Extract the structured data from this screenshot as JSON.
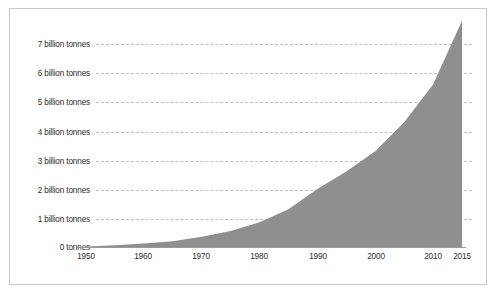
{
  "chart_data": {
    "type": "area",
    "title": "",
    "subtitle": "",
    "xlabel": "",
    "ylabel": "",
    "grid": true,
    "legend": "none",
    "series_color": "#8f8f8f",
    "xlim": [
      1950,
      2015
    ],
    "ylim": [
      0,
      7.8
    ],
    "x_tick_labels": [
      "1950",
      "1960",
      "1970",
      "1980",
      "1990",
      "2000",
      "2010",
      "2015"
    ],
    "x_ticks": [
      1950,
      1960,
      1970,
      1980,
      1990,
      2000,
      2010,
      2015
    ],
    "y_tick_labels": [
      "0 tonnes",
      "1 billion tonnes",
      "2 billion tonnes",
      "3 billion tonnes",
      "4 billion tonnes",
      "5 billion tonnes",
      "6 billion tonnes",
      "7 billion tonnes"
    ],
    "y_ticks": [
      0,
      1,
      2,
      3,
      4,
      5,
      6,
      7
    ],
    "x": [
      1950,
      1955,
      1960,
      1965,
      1970,
      1975,
      1980,
      1985,
      1990,
      1995,
      2000,
      2005,
      2010,
      2015
    ],
    "values": [
      0.02,
      0.06,
      0.12,
      0.2,
      0.35,
      0.55,
      0.85,
      1.3,
      2.0,
      2.6,
      3.3,
      4.3,
      5.6,
      7.8
    ],
    "series": [
      {
        "name": "Global plastic production",
        "values": [
          0.02,
          0.06,
          0.12,
          0.2,
          0.35,
          0.55,
          0.85,
          1.3,
          2.0,
          2.6,
          3.3,
          4.3,
          5.6,
          7.8
        ]
      }
    ]
  },
  "colors": {
    "area_fill": "#8f8f8f",
    "gridline": "#bfbfbf",
    "axis": "#9a9a9a",
    "frame_border": "#c9c9c9",
    "text": "#2b2b2b",
    "background": "#ffffff"
  }
}
